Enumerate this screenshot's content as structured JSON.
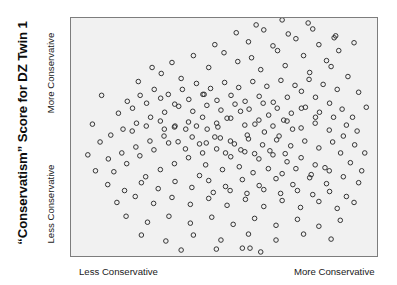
{
  "figure": {
    "title": "“Conservatism” Score for DZ Twin 1",
    "background_color": "#ffffff",
    "plot_background_color": "#f1f1f1",
    "plot_border_color": "#7d7d7d",
    "marker_color": "#333333"
  },
  "axes": {
    "y_axis": {
      "title": "“Conservatism” Score for DZ Twin 1",
      "low_label": "Less Conservative",
      "high_label": "More Conservative"
    },
    "x_axis": {
      "low_label": "Less Conservative",
      "high_label": "More Conservative"
    }
  },
  "chart_data": {
    "type": "scatter",
    "title": "“Conservatism” Score for DZ Twin 1",
    "xlabel": "",
    "ylabel": "“Conservatism” Score for DZ Twin 1",
    "xlim": [
      0,
      100
    ],
    "ylim": [
      0,
      100
    ],
    "grid": false,
    "legend": null,
    "marker": {
      "style": "open-circle",
      "radius_px": 2.3,
      "stroke_color": "#333333",
      "stroke_width": 1.0,
      "fill": "none"
    },
    "xtick_labels": [
      "Less Conservative",
      "More Conservative"
    ],
    "ytick_labels": [
      "Less Conservative",
      "More Conservative"
    ],
    "n_points": 236,
    "series": [
      {
        "name": "DZ twin pairs",
        "points": [
          [
            36.0,
            74.6
          ],
          [
            43.5,
            67.9
          ],
          [
            51.0,
            57.9
          ],
          [
            55.4,
            60.8
          ],
          [
            64.6,
            59.2
          ],
          [
            60.1,
            55.4
          ],
          [
            69.5,
            57.1
          ],
          [
            75.3,
            62.1
          ],
          [
            79.9,
            58.3
          ],
          [
            72.4,
            53.3
          ],
          [
            68.0,
            50.4
          ],
          [
            63.2,
            52.1
          ],
          [
            57.6,
            50.8
          ],
          [
            52.1,
            48.3
          ],
          [
            47.0,
            50.0
          ],
          [
            42.0,
            47.1
          ],
          [
            37.4,
            45.0
          ],
          [
            31.9,
            47.5
          ],
          [
            27.1,
            44.6
          ],
          [
            22.5,
            42.1
          ],
          [
            18.2,
            38.8
          ],
          [
            14.0,
            35.4
          ],
          [
            24.4,
            33.3
          ],
          [
            29.2,
            36.3
          ],
          [
            33.8,
            38.8
          ],
          [
            38.4,
            41.3
          ],
          [
            43.0,
            43.3
          ],
          [
            47.6,
            45.0
          ],
          [
            52.2,
            41.7
          ],
          [
            56.8,
            43.8
          ],
          [
            61.4,
            40.8
          ],
          [
            66.0,
            42.5
          ],
          [
            70.6,
            39.6
          ],
          [
            75.2,
            41.3
          ],
          [
            79.8,
            38.3
          ],
          [
            84.4,
            35.8
          ],
          [
            88.1,
            43.3
          ],
          [
            91.3,
            39.2
          ],
          [
            85.5,
            47.9
          ],
          [
            81.0,
            45.4
          ],
          [
            76.4,
            48.3
          ],
          [
            71.8,
            46.3
          ],
          [
            67.2,
            48.8
          ],
          [
            62.6,
            46.7
          ],
          [
            58.0,
            49.2
          ],
          [
            53.4,
            47.1
          ],
          [
            48.8,
            49.6
          ],
          [
            44.2,
            47.5
          ],
          [
            39.6,
            50.0
          ],
          [
            35.0,
            48.0
          ],
          [
            30.4,
            50.4
          ],
          [
            25.8,
            48.3
          ],
          [
            21.2,
            45.8
          ],
          [
            16.6,
            43.3
          ],
          [
            12.2,
            40.8
          ],
          [
            20.0,
            52.5
          ],
          [
            24.6,
            54.6
          ],
          [
            29.2,
            56.7
          ],
          [
            33.8,
            54.2
          ],
          [
            38.4,
            56.3
          ],
          [
            43.0,
            58.3
          ],
          [
            47.6,
            55.8
          ],
          [
            52.2,
            57.9
          ],
          [
            56.8,
            55.0
          ],
          [
            61.4,
            57.1
          ],
          [
            66.0,
            54.6
          ],
          [
            70.6,
            56.7
          ],
          [
            75.2,
            53.8
          ],
          [
            79.8,
            55.8
          ],
          [
            84.4,
            52.9
          ],
          [
            89.0,
            50.4
          ],
          [
            92.7,
            46.7
          ],
          [
            90.0,
            55.0
          ],
          [
            85.8,
            58.3
          ],
          [
            81.2,
            60.4
          ],
          [
            76.6,
            62.5
          ],
          [
            72.0,
            60.0
          ],
          [
            67.4,
            62.1
          ],
          [
            62.8,
            64.2
          ],
          [
            58.2,
            61.7
          ],
          [
            53.6,
            63.8
          ],
          [
            49.0,
            61.3
          ],
          [
            44.4,
            63.3
          ],
          [
            39.8,
            60.8
          ],
          [
            35.2,
            62.9
          ],
          [
            30.6,
            60.4
          ],
          [
            26.0,
            58.3
          ],
          [
            21.4,
            55.8
          ],
          [
            17.0,
            53.3
          ],
          [
            13.0,
            50.8
          ],
          [
            9.5,
            47.9
          ],
          [
            15.5,
            60.0
          ],
          [
            20.1,
            62.1
          ],
          [
            24.7,
            64.2
          ],
          [
            29.3,
            66.3
          ],
          [
            33.9,
            63.8
          ],
          [
            38.5,
            65.8
          ],
          [
            43.1,
            67.9
          ],
          [
            47.7,
            65.4
          ],
          [
            52.3,
            67.5
          ],
          [
            56.9,
            65.0
          ],
          [
            61.5,
            67.1
          ],
          [
            66.1,
            64.6
          ],
          [
            70.7,
            66.7
          ],
          [
            75.3,
            69.2
          ],
          [
            79.9,
            66.7
          ],
          [
            84.5,
            64.2
          ],
          [
            88.6,
            61.7
          ],
          [
            92.0,
            58.3
          ],
          [
            87.0,
            70.0
          ],
          [
            82.4,
            72.1
          ],
          [
            77.8,
            74.2
          ],
          [
            73.2,
            71.7
          ],
          [
            68.6,
            73.8
          ],
          [
            64.0,
            71.3
          ],
          [
            59.4,
            73.3
          ],
          [
            54.8,
            70.8
          ],
          [
            50.2,
            72.9
          ],
          [
            45.6,
            70.4
          ],
          [
            41.0,
            72.5
          ],
          [
            36.4,
            70.0
          ],
          [
            31.8,
            67.9
          ],
          [
            27.2,
            70.0
          ],
          [
            22.6,
            67.5
          ],
          [
            18.4,
            65.0
          ],
          [
            45.0,
            79.2
          ],
          [
            54.5,
            81.7
          ],
          [
            62.0,
            78.3
          ],
          [
            70.0,
            80.0
          ],
          [
            78.0,
            77.1
          ],
          [
            85.0,
            79.6
          ],
          [
            50.0,
            85.4
          ],
          [
            59.0,
            83.3
          ],
          [
            67.5,
            86.3
          ],
          [
            76.0,
            84.2
          ],
          [
            83.5,
            82.1
          ],
          [
            40.0,
            84.2
          ],
          [
            33.0,
            81.3
          ],
          [
            26.5,
            79.2
          ],
          [
            58.0,
            90.0
          ],
          [
            66.0,
            88.3
          ],
          [
            73.5,
            91.3
          ],
          [
            81.0,
            88.8
          ],
          [
            87.5,
            86.3
          ],
          [
            47.0,
            88.8
          ],
          [
            54.0,
            93.8
          ],
          [
            63.0,
            95.0
          ],
          [
            71.0,
            93.3
          ],
          [
            79.0,
            95.4
          ],
          [
            86.5,
            92.5
          ],
          [
            92.5,
            89.6
          ],
          [
            69.0,
            99.2
          ],
          [
            77.5,
            97.9
          ],
          [
            60.5,
            97.1
          ],
          [
            12.0,
            30.0
          ],
          [
            17.5,
            27.5
          ],
          [
            23.0,
            30.8
          ],
          [
            28.5,
            28.3
          ],
          [
            34.0,
            31.3
          ],
          [
            39.5,
            28.8
          ],
          [
            45.0,
            31.7
          ],
          [
            50.5,
            29.2
          ],
          [
            56.0,
            32.1
          ],
          [
            61.5,
            29.6
          ],
          [
            67.0,
            32.5
          ],
          [
            72.5,
            30.0
          ],
          [
            78.0,
            32.9
          ],
          [
            83.5,
            30.4
          ],
          [
            89.0,
            33.3
          ],
          [
            94.0,
            30.8
          ],
          [
            15.0,
            22.5
          ],
          [
            21.0,
            25.0
          ],
          [
            27.0,
            22.1
          ],
          [
            33.0,
            24.6
          ],
          [
            39.0,
            21.7
          ],
          [
            45.0,
            24.2
          ],
          [
            51.0,
            21.3
          ],
          [
            57.0,
            23.8
          ],
          [
            63.0,
            20.8
          ],
          [
            69.0,
            23.3
          ],
          [
            75.0,
            20.4
          ],
          [
            81.0,
            22.9
          ],
          [
            87.0,
            20.0
          ],
          [
            92.5,
            22.5
          ],
          [
            18.0,
            16.7
          ],
          [
            25.0,
            14.2
          ],
          [
            32.0,
            16.7
          ],
          [
            39.0,
            13.8
          ],
          [
            46.0,
            16.3
          ],
          [
            53.0,
            13.3
          ],
          [
            60.0,
            15.8
          ],
          [
            67.0,
            12.9
          ],
          [
            74.0,
            15.4
          ],
          [
            81.0,
            12.5
          ],
          [
            88.0,
            15.0
          ],
          [
            23.0,
            8.8
          ],
          [
            31.0,
            6.3
          ],
          [
            40.0,
            8.8
          ],
          [
            49.0,
            6.7
          ],
          [
            58.0,
            9.2
          ],
          [
            67.0,
            6.7
          ],
          [
            76.0,
            9.2
          ],
          [
            85.0,
            7.1
          ],
          [
            36.0,
            2.5
          ],
          [
            47.5,
            2.9
          ],
          [
            56.0,
            3.3
          ],
          [
            58.5,
            3.3
          ],
          [
            62.0,
            1.7
          ],
          [
            8.0,
            35.8
          ],
          [
            5.5,
            42.5
          ],
          [
            7.0,
            55.4
          ],
          [
            10.0,
            67.5
          ],
          [
            29.5,
            76.7
          ],
          [
            22.0,
            73.3
          ],
          [
            44.0,
            38.3
          ],
          [
            49.5,
            36.3
          ],
          [
            55.0,
            37.5
          ],
          [
            59.5,
            35.0
          ],
          [
            64.5,
            36.7
          ],
          [
            69.0,
            34.6
          ],
          [
            73.5,
            36.7
          ],
          [
            78.5,
            34.2
          ],
          [
            83.0,
            37.1
          ],
          [
            42.0,
            33.8
          ],
          [
            46.5,
            26.7
          ],
          [
            52.0,
            27.5
          ],
          [
            57.5,
            26.3
          ],
          [
            63.0,
            27.9
          ],
          [
            68.5,
            26.3
          ],
          [
            74.0,
            27.5
          ],
          [
            79.0,
            25.8
          ],
          [
            84.5,
            27.1
          ],
          [
            90.0,
            25.0
          ],
          [
            95.0,
            35.8
          ],
          [
            96.0,
            43.3
          ],
          [
            93.5,
            52.5
          ],
          [
            96.5,
            62.5
          ],
          [
            94.0,
            68.8
          ],
          [
            90.5,
            75.4
          ],
          [
            86.0,
            91.7
          ],
          [
            50.5,
            43.3
          ],
          [
            55.5,
            44.6
          ],
          [
            60.0,
            43.0
          ],
          [
            65.0,
            44.2
          ],
          [
            70.0,
            43.0
          ],
          [
            48.0,
            54.2
          ],
          [
            44.5,
            53.3
          ],
          [
            41.0,
            54.6
          ],
          [
            37.5,
            53.3
          ],
          [
            34.0,
            54.6
          ],
          [
            30.5,
            53.3
          ]
        ]
      }
    ]
  }
}
